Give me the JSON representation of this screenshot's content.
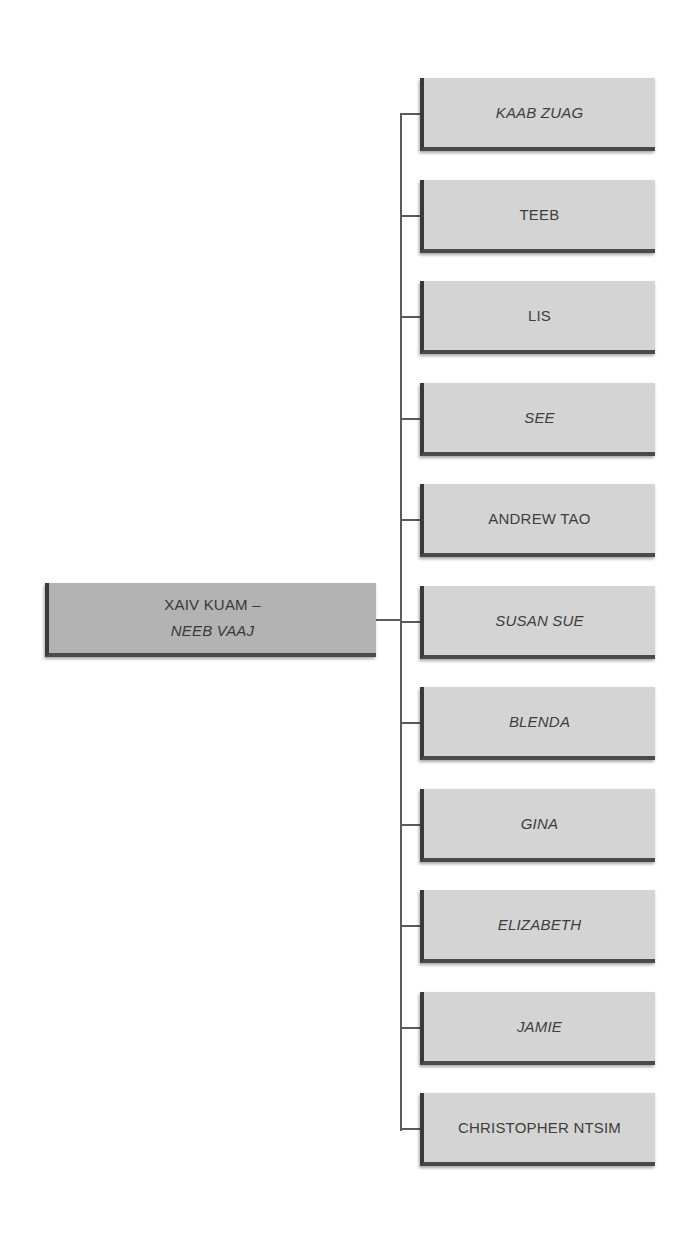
{
  "root": {
    "line1": "XAIV KUAM –",
    "line2": "NEEB VAAJ",
    "line1_style": "normal",
    "line2_style": "italic"
  },
  "children": [
    {
      "label": "KAAB ZUAG",
      "style": "italic"
    },
    {
      "label": "TEEB",
      "style": "normal"
    },
    {
      "label": "LIS",
      "style": "normal"
    },
    {
      "label": "SEE",
      "style": "italic"
    },
    {
      "label": "ANDREW TAO",
      "style": "normal"
    },
    {
      "label": "SUSAN SUE",
      "style": "italic"
    },
    {
      "label": "BLENDA",
      "style": "italic"
    },
    {
      "label": "GINA",
      "style": "italic"
    },
    {
      "label": "ELIZABETH",
      "style": "italic"
    },
    {
      "label": "JAMIE",
      "style": "italic"
    },
    {
      "label": "CHRISTOPHER NTSIM",
      "style": "normal"
    }
  ],
  "colors": {
    "root_fill": "#b3b3b3",
    "child_fill": "#d4d4d4",
    "connector": "#5a5a5a",
    "text": "#3e3e3e"
  }
}
